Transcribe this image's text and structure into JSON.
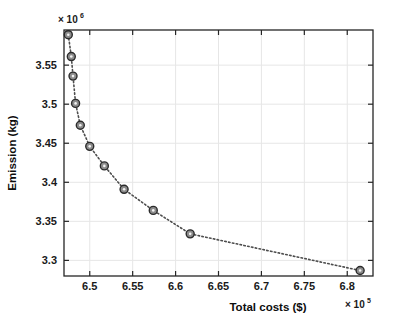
{
  "chart_data": {
    "type": "scatter",
    "title": "",
    "xlabel": "Total costs ($)",
    "ylabel": "Emission (kg)",
    "x_multiplier": "× 10",
    "x_multiplier_exp": "5",
    "y_multiplier": "× 10",
    "y_multiplier_exp": "6",
    "xlim": [
      6.47,
      6.83
    ],
    "ylim": [
      3.28,
      3.595
    ],
    "xticks": [
      6.5,
      6.55,
      6.6,
      6.65,
      6.7,
      6.75,
      6.8
    ],
    "xtick_labels": [
      "6.5",
      "6.55",
      "6.6",
      "6.65",
      "6.7",
      "6.75",
      "6.8"
    ],
    "yticks": [
      3.3,
      3.35,
      3.4,
      3.45,
      3.5,
      3.55
    ],
    "ytick_labels": [
      "3.3",
      "3.35",
      "3.4",
      "3.45",
      "3.5",
      "3.55"
    ],
    "grid": true,
    "legend": null,
    "line_style": "dotted",
    "marker": "circle",
    "marker_fill": "#8c8c8c",
    "marker_edge": "#2b2b2b",
    "line_color": "#4d4d4d",
    "axis_color": "#262626",
    "grid_color": "#e6e6e6",
    "background": "#ffffff",
    "x": [
      6.475,
      6.4785,
      6.4805,
      6.4835,
      6.489,
      6.5,
      6.517,
      6.54,
      6.574,
      6.617,
      6.815
    ],
    "y": [
      3.589,
      3.561,
      3.536,
      3.501,
      3.473,
      3.446,
      3.421,
      3.391,
      3.364,
      3.334,
      3.287
    ],
    "points": [
      {
        "x": 6.475,
        "y": 3.589
      },
      {
        "x": 6.4785,
        "y": 3.561
      },
      {
        "x": 6.4805,
        "y": 3.536
      },
      {
        "x": 6.4835,
        "y": 3.501
      },
      {
        "x": 6.489,
        "y": 3.473
      },
      {
        "x": 6.5,
        "y": 3.446
      },
      {
        "x": 6.517,
        "y": 3.421
      },
      {
        "x": 6.54,
        "y": 3.391
      },
      {
        "x": 6.574,
        "y": 3.364
      },
      {
        "x": 6.617,
        "y": 3.334
      },
      {
        "x": 6.815,
        "y": 3.287
      }
    ]
  }
}
